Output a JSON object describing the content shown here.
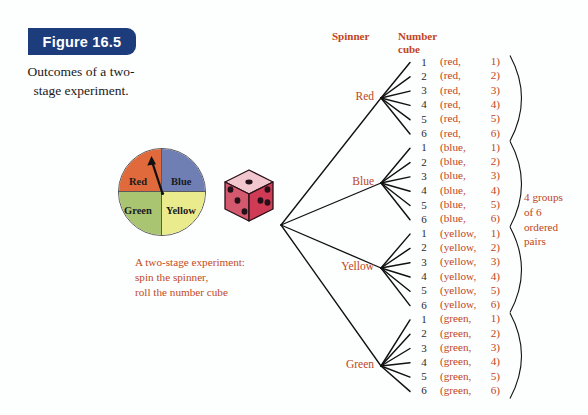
{
  "figure": {
    "badge_label": "Figure 16.5",
    "caption": "Outcomes of a two-stage experiment."
  },
  "colors": {
    "badge_bg": "#1d3c7c",
    "accent_text": "#c0451d",
    "spinner_red": "#e06a3c",
    "spinner_blue": "#6f7fb4",
    "spinner_green": "#aac572",
    "spinner_yellow": "#eaeb8d",
    "die_top": "#f2c6cf",
    "die_left": "#d45a72",
    "die_right": "#cf3b55",
    "die_pip": "#241018",
    "tree_line": "#111111"
  },
  "spinner": {
    "name": "four-color-spinner",
    "sectors": [
      {
        "label": "Red",
        "color": "#e06a3c"
      },
      {
        "label": "Blue",
        "color": "#6f7fb4"
      },
      {
        "label": "Green",
        "color": "#aac572"
      },
      {
        "label": "Yellow",
        "color": "#eaeb8d"
      }
    ],
    "needle_points_to": "Red"
  },
  "die": {
    "name": "number-cube",
    "faces_visible": {
      "top": 1,
      "left": 3,
      "right": 3
    }
  },
  "experiment_note": {
    "line1": "A two-stage experiment:",
    "line2": "spin the spinner,",
    "line3": "roll the number cube"
  },
  "headers": {
    "stage1": "Spinner",
    "stage2_line1": "Number",
    "stage2_line2": "cube"
  },
  "tree": {
    "stage1_branches": [
      {
        "label": "Red",
        "y": 98
      },
      {
        "label": "Blue",
        "y": 183
      },
      {
        "label": "Yellow",
        "y": 268
      },
      {
        "label": "Green",
        "y": 366
      }
    ],
    "cube_numbers": [
      "1",
      "2",
      "3",
      "4",
      "5",
      "6"
    ]
  },
  "outcomes": {
    "groups": [
      {
        "name": "red",
        "pairs": [
          {
            "first": "(red,",
            "second": "1)"
          },
          {
            "first": "(red,",
            "second": "2)"
          },
          {
            "first": "(red,",
            "second": "3)"
          },
          {
            "first": "(red,",
            "second": "4)"
          },
          {
            "first": "(red,",
            "second": "5)"
          },
          {
            "first": "(red,",
            "second": "6)"
          }
        ]
      },
      {
        "name": "blue",
        "pairs": [
          {
            "first": "(blue,",
            "second": "1)"
          },
          {
            "first": "(blue,",
            "second": "2)"
          },
          {
            "first": "(blue,",
            "second": "3)"
          },
          {
            "first": "(blue,",
            "second": "4)"
          },
          {
            "first": "(blue,",
            "second": "5)"
          },
          {
            "first": "(blue,",
            "second": "6)"
          }
        ]
      },
      {
        "name": "yellow",
        "pairs": [
          {
            "first": "(yellow,",
            "second": "1)"
          },
          {
            "first": "(yellow,",
            "second": "2)"
          },
          {
            "first": "(yellow,",
            "second": "3)"
          },
          {
            "first": "(yellow,",
            "second": "4)"
          },
          {
            "first": "(yellow,",
            "second": "5)"
          },
          {
            "first": "(yellow,",
            "second": "6)"
          }
        ]
      },
      {
        "name": "green",
        "pairs": [
          {
            "first": "(green,",
            "second": "1)"
          },
          {
            "first": "(green,",
            "second": "2)"
          },
          {
            "first": "(green,",
            "second": "3)"
          },
          {
            "first": "(green,",
            "second": "4)"
          },
          {
            "first": "(green,",
            "second": "5)"
          },
          {
            "first": "(green,",
            "second": "6)"
          }
        ]
      }
    ]
  },
  "right_note": {
    "line1": "4 groups",
    "line2": "of 6",
    "line3": "ordered",
    "line4": "pairs"
  }
}
